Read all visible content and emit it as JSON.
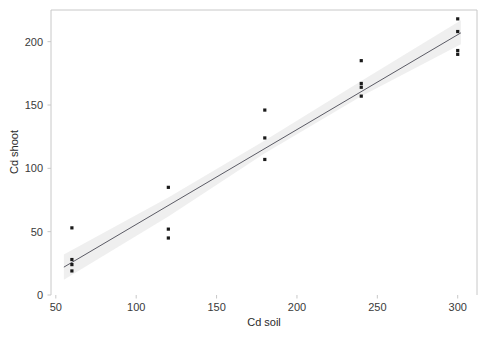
{
  "chart_data": {
    "type": "scatter",
    "title": "",
    "subtitle": "",
    "xlabel": "Cd soil",
    "ylabel": "Cd shoot",
    "xlim": [
      47,
      312
    ],
    "ylim": [
      0,
      225
    ],
    "xticks": [
      50,
      100,
      150,
      200,
      250,
      300
    ],
    "xtick_labels": [
      "50",
      "100",
      "150",
      "200",
      "250",
      "300"
    ],
    "yticks": [
      0,
      50,
      100,
      150,
      200
    ],
    "ytick_labels": [
      "0",
      "50",
      "100",
      "150",
      "200"
    ],
    "grid": false,
    "legend": null,
    "legend_position": "none",
    "annotations": [],
    "point_color": "#1a1a1a",
    "line_color": "#4a4a55",
    "band_color": "#ececec",
    "frame_color": "#c8c8c8",
    "points": [
      {
        "x": 60,
        "y": 53
      },
      {
        "x": 60,
        "y": 28
      },
      {
        "x": 60,
        "y": 24
      },
      {
        "x": 60,
        "y": 19
      },
      {
        "x": 120,
        "y": 85
      },
      {
        "x": 120,
        "y": 52
      },
      {
        "x": 120,
        "y": 45
      },
      {
        "x": 180,
        "y": 146
      },
      {
        "x": 180,
        "y": 124
      },
      {
        "x": 180,
        "y": 107
      },
      {
        "x": 240,
        "y": 185
      },
      {
        "x": 240,
        "y": 167
      },
      {
        "x": 240,
        "y": 164
      },
      {
        "x": 240,
        "y": 157
      },
      {
        "x": 300,
        "y": 218
      },
      {
        "x": 300,
        "y": 208
      },
      {
        "x": 300,
        "y": 193
      },
      {
        "x": 300,
        "y": 190
      }
    ],
    "fit_line": {
      "x_start": 55,
      "y_start": 22,
      "x_end": 302,
      "y_end": 207,
      "slope": 0.749,
      "intercept": -19.2
    },
    "confidence_band": {
      "upper": [
        {
          "x": 55,
          "y": 32
        },
        {
          "x": 120,
          "y": 77
        },
        {
          "x": 180,
          "y": 122
        },
        {
          "x": 240,
          "y": 169
        },
        {
          "x": 302,
          "y": 217
        }
      ],
      "lower": [
        {
          "x": 55,
          "y": 12
        },
        {
          "x": 120,
          "y": 62
        },
        {
          "x": 180,
          "y": 112
        },
        {
          "x": 240,
          "y": 157
        },
        {
          "x": 302,
          "y": 198
        }
      ]
    }
  }
}
